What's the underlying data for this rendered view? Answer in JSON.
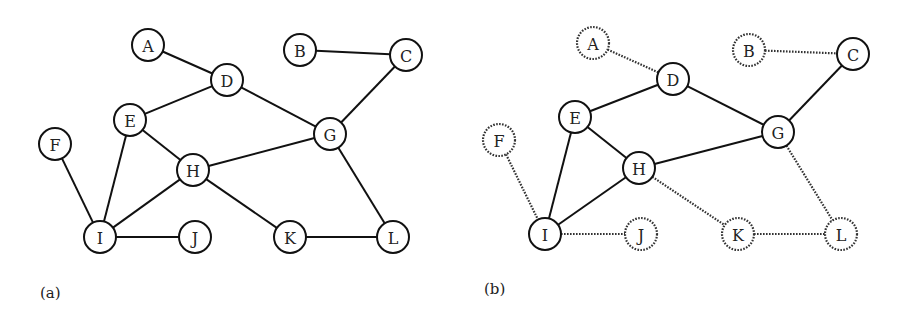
{
  "node_radius": 16,
  "panels": [
    {
      "id": "a",
      "label": "(a)",
      "label_pos": [
        40,
        284
      ],
      "nodes": [
        {
          "id": "A",
          "x": 148,
          "y": 45,
          "style": "solid"
        },
        {
          "id": "B",
          "x": 300,
          "y": 50,
          "style": "solid"
        },
        {
          "id": "C",
          "x": 406,
          "y": 55,
          "style": "solid"
        },
        {
          "id": "D",
          "x": 227,
          "y": 80,
          "style": "solid"
        },
        {
          "id": "E",
          "x": 130,
          "y": 120,
          "style": "solid"
        },
        {
          "id": "F",
          "x": 55,
          "y": 144,
          "style": "solid"
        },
        {
          "id": "G",
          "x": 330,
          "y": 134,
          "style": "solid"
        },
        {
          "id": "H",
          "x": 193,
          "y": 170,
          "style": "solid"
        },
        {
          "id": "I",
          "x": 100,
          "y": 237,
          "style": "solid"
        },
        {
          "id": "J",
          "x": 195,
          "y": 237,
          "style": "solid"
        },
        {
          "id": "K",
          "x": 290,
          "y": 237,
          "style": "solid"
        },
        {
          "id": "L",
          "x": 393,
          "y": 237,
          "style": "solid"
        }
      ],
      "edges": [
        {
          "from": "A",
          "to": "D",
          "style": "solid"
        },
        {
          "from": "B",
          "to": "C",
          "style": "solid"
        },
        {
          "from": "C",
          "to": "G",
          "style": "solid"
        },
        {
          "from": "D",
          "to": "E",
          "style": "solid"
        },
        {
          "from": "D",
          "to": "G",
          "style": "solid"
        },
        {
          "from": "E",
          "to": "H",
          "style": "solid"
        },
        {
          "from": "E",
          "to": "I",
          "style": "solid"
        },
        {
          "from": "F",
          "to": "I",
          "style": "solid"
        },
        {
          "from": "G",
          "to": "H",
          "style": "solid"
        },
        {
          "from": "G",
          "to": "L",
          "style": "solid"
        },
        {
          "from": "H",
          "to": "I",
          "style": "solid"
        },
        {
          "from": "H",
          "to": "K",
          "style": "solid"
        },
        {
          "from": "I",
          "to": "J",
          "style": "solid"
        },
        {
          "from": "K",
          "to": "L",
          "style": "solid"
        }
      ]
    },
    {
      "id": "b",
      "label": "(b)",
      "label_pos": [
        484,
        280
      ],
      "nodes": [
        {
          "id": "A",
          "x": 593,
          "y": 43,
          "style": "dotted"
        },
        {
          "id": "B",
          "x": 749,
          "y": 50,
          "style": "dotted"
        },
        {
          "id": "C",
          "x": 853,
          "y": 54,
          "style": "solid"
        },
        {
          "id": "D",
          "x": 673,
          "y": 79,
          "style": "solid"
        },
        {
          "id": "E",
          "x": 575,
          "y": 117,
          "style": "solid"
        },
        {
          "id": "F",
          "x": 499,
          "y": 140,
          "style": "dotted"
        },
        {
          "id": "G",
          "x": 778,
          "y": 132,
          "style": "solid"
        },
        {
          "id": "H",
          "x": 639,
          "y": 168,
          "style": "solid"
        },
        {
          "id": "I",
          "x": 545,
          "y": 234,
          "style": "solid"
        },
        {
          "id": "J",
          "x": 641,
          "y": 234,
          "style": "dotted"
        },
        {
          "id": "K",
          "x": 738,
          "y": 234,
          "style": "dotted"
        },
        {
          "id": "L",
          "x": 841,
          "y": 234,
          "style": "dotted"
        }
      ],
      "edges": [
        {
          "from": "A",
          "to": "D",
          "style": "dotted"
        },
        {
          "from": "B",
          "to": "C",
          "style": "dotted"
        },
        {
          "from": "C",
          "to": "G",
          "style": "solid"
        },
        {
          "from": "D",
          "to": "E",
          "style": "solid"
        },
        {
          "from": "D",
          "to": "G",
          "style": "solid"
        },
        {
          "from": "E",
          "to": "H",
          "style": "solid"
        },
        {
          "from": "E",
          "to": "I",
          "style": "solid"
        },
        {
          "from": "F",
          "to": "I",
          "style": "dotted"
        },
        {
          "from": "G",
          "to": "H",
          "style": "solid"
        },
        {
          "from": "G",
          "to": "L",
          "style": "dotted"
        },
        {
          "from": "H",
          "to": "I",
          "style": "solid"
        },
        {
          "from": "H",
          "to": "K",
          "style": "dotted"
        },
        {
          "from": "I",
          "to": "J",
          "style": "dotted"
        },
        {
          "from": "K",
          "to": "L",
          "style": "dotted"
        }
      ]
    }
  ]
}
